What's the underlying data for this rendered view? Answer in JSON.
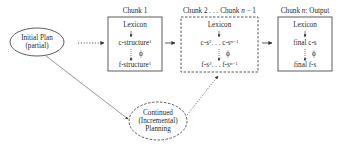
{
  "initial_plan": {
    "line1": "Initial Plan",
    "line2": "(partial)"
  },
  "continued": {
    "line1": "Continued",
    "line2": "(Incremental)",
    "line3": "Planning"
  },
  "chunk1": {
    "title": "Chunk 1",
    "lexicon": "Lexicon",
    "c": "c-structure",
    "c_sup": "1",
    "phi": "ϕ",
    "f": "f-structure",
    "f_sup": "1"
  },
  "chunk2": {
    "title_a": "Chunk 2 . . . Chunk ",
    "title_n": "n",
    "title_b": " − 1",
    "lexicon": "Lexicon",
    "c_a": "c-s",
    "c_sup1": "2",
    "c_mid": ". . . c-s",
    "c_sup2": "n−1",
    "phi": "ϕ",
    "f_a": "f-s",
    "f_sup1": "2",
    "f_mid": ". . . f-s",
    "f_sup2": "n−1"
  },
  "chunkn": {
    "title_a": "Chunk ",
    "title_n": "n",
    "title_b": ": Output",
    "lexicon": "Lexicon",
    "c": "final c-s",
    "phi": "ϕ",
    "f": "final f-s"
  }
}
